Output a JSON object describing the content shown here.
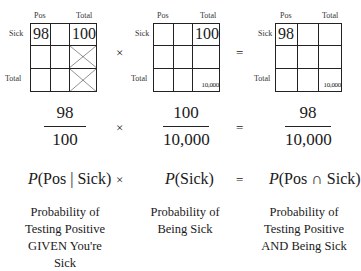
{
  "grids": [
    {
      "col_labels": {
        "pos": "Pos",
        "total": "Total"
      },
      "row_labels": {
        "sick": "Sick",
        "total": "Total"
      },
      "cells": {
        "sick_pos": "98",
        "sick_total": "100",
        "total_total": ""
      },
      "crossed_cells": [
        "row2_total",
        "row3_total"
      ]
    },
    {
      "col_labels": {
        "pos": "Pos",
        "total": "Total"
      },
      "row_labels": {
        "sick": "Sick",
        "total": "Total"
      },
      "cells": {
        "sick_pos": "",
        "sick_total": "100",
        "total_total": "10,000"
      }
    },
    {
      "col_labels": {
        "pos": "Pos",
        "total": "Total"
      },
      "row_labels": {
        "sick": "Sick",
        "total": "Total"
      },
      "cells": {
        "sick_pos": "98",
        "sick_total": "",
        "total_total": "10,000"
      }
    }
  ],
  "operators": {
    "times": "×",
    "equals": "="
  },
  "fractions": [
    {
      "num": "98",
      "den": "100"
    },
    {
      "num": "100",
      "den": "10,000"
    },
    {
      "num": "98",
      "den": "10,000"
    }
  ],
  "probabilities": [
    {
      "p": "P",
      "args": "(Pos | Sick)"
    },
    {
      "p": "P",
      "args": "(Sick)"
    },
    {
      "p": "P",
      "args": "(Pos ∩ Sick)"
    }
  ],
  "descriptions": [
    [
      "Probability of",
      "Testing Positive",
      "GIVEN You're",
      "Sick"
    ],
    [
      "Probability of",
      "Being Sick"
    ],
    [
      "Probability of",
      "Testing Positive",
      "AND Being Sick"
    ]
  ]
}
